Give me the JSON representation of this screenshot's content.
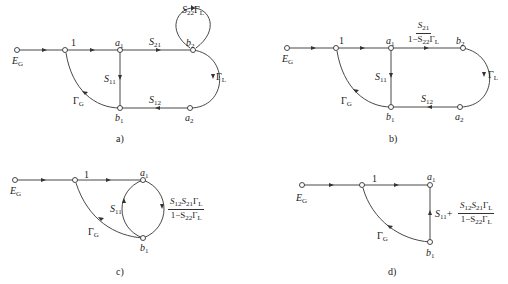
{
  "figure": {
    "panels": [
      {
        "id": "a",
        "caption": "a)",
        "nodes": [
          "E_G",
          "1",
          "a1",
          "b2",
          "b1",
          "a2"
        ],
        "labels": {
          "source": "E",
          "source_sub": "G",
          "one": "1",
          "a1": "a",
          "a1_sub": "1",
          "b2": "b",
          "b2_sub": "2",
          "b1": "b",
          "b1_sub": "1",
          "a2": "a",
          "a2_sub": "2",
          "s21": "S",
          "s21_sub": "21",
          "s11": "S",
          "s11_sub": "11",
          "s12": "S",
          "s12_sub": "12",
          "gl": "Γ",
          "gl_sub": "L",
          "gg": "Γ",
          "gg_sub": "G",
          "loop": "S",
          "loop_sub": "22",
          "loop_g": "Γ",
          "loop_g_sub": "L"
        }
      },
      {
        "id": "b",
        "caption": "b)",
        "nodes": [
          "E_G",
          "1",
          "a1",
          "b2",
          "b1",
          "a2"
        ],
        "labels": {
          "source": "E",
          "source_sub": "G",
          "one": "1",
          "a1": "a",
          "a1_sub": "1",
          "b2": "b",
          "b2_sub": "2",
          "b1": "b",
          "b1_sub": "1",
          "a2": "a",
          "a2_sub": "2",
          "frac_num": "S",
          "frac_num_sub": "21",
          "frac_den_a": "1−S",
          "frac_den_sub": "22",
          "frac_den_g": "Γ",
          "frac_den_g_sub": "L",
          "s11": "S",
          "s11_sub": "11",
          "s12": "S",
          "s12_sub": "12",
          "gl": "Γ",
          "gl_sub": "L",
          "gg": "Γ",
          "gg_sub": "G"
        }
      },
      {
        "id": "c",
        "caption": "c)",
        "nodes": [
          "E_G",
          "1",
          "a1",
          "b1"
        ],
        "labels": {
          "source": "E",
          "source_sub": "G",
          "one": "1",
          "a1": "a",
          "a1_sub": "1",
          "b1": "b",
          "b1_sub": "1",
          "s11": "S",
          "s11_sub": "11",
          "gg": "Γ",
          "gg_sub": "G",
          "num_s12": "S",
          "num_s12_sub": "12",
          "num_s21": "S",
          "num_s21_sub": "21",
          "num_g": "Γ",
          "num_g_sub": "L",
          "den_a": "1−S",
          "den_sub": "22",
          "den_g": "Γ",
          "den_g_sub": "L"
        }
      },
      {
        "id": "d",
        "caption": "d)",
        "nodes": [
          "E_G",
          "1",
          "a1",
          "b1"
        ],
        "labels": {
          "source": "E",
          "source_sub": "G",
          "one": "1",
          "a1": "a",
          "a1_sub": "1",
          "b1": "b",
          "b1_sub": "1",
          "s11_plus": "S",
          "s11_plus_sub": "11",
          "plus": "+",
          "gg": "Γ",
          "gg_sub": "G",
          "num_s12": "S",
          "num_s12_sub": "12",
          "num_s21": "S",
          "num_s21_sub": "21",
          "num_g": "Γ",
          "num_g_sub": "L",
          "den_a": "1−S",
          "den_sub": "22",
          "den_g": "Γ",
          "den_g_sub": "L"
        }
      }
    ]
  }
}
